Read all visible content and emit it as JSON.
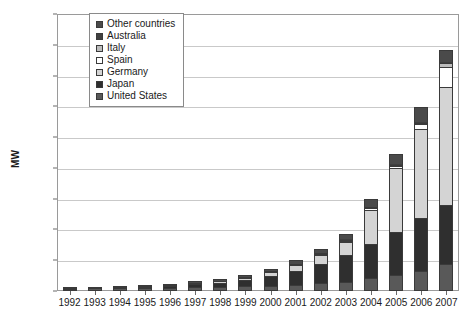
{
  "chart_data": {
    "type": "bar",
    "stacked": true,
    "title": "",
    "xlabel": "",
    "ylabel": "MW",
    "ylim": [
      0,
      9000
    ],
    "ytick_step": 1000,
    "yticks": [
      0,
      1000,
      2000,
      3000,
      4000,
      5000,
      6000,
      7000,
      8000,
      9000
    ],
    "grid": true,
    "legend_position": "top-left-inside",
    "categories": [
      "1992",
      "1993",
      "1994",
      "1995",
      "1996",
      "1997",
      "1998",
      "1999",
      "2000",
      "2001",
      "2002",
      "2003",
      "2004",
      "2005",
      "2006",
      "2007"
    ],
    "series": [
      {
        "name": "United States",
        "color": "#595959",
        "values": [
          44,
          50,
          58,
          66,
          77,
          89,
          100,
          117,
          139,
          168,
          212,
          275,
          376,
          479,
          624,
          831
        ]
      },
      {
        "name": "Japan",
        "color": "#2f2f2f",
        "values": [
          19,
          24,
          31,
          43,
          60,
          91,
          133,
          209,
          318,
          453,
          637,
          860,
          1132,
          1422,
          1708,
          1919
        ]
      },
      {
        "name": "Germany",
        "color": "#d4d4d4",
        "values": [
          6,
          9,
          12,
          18,
          28,
          42,
          54,
          70,
          114,
          195,
          296,
          435,
          1105,
          2056,
          2899,
          3846
        ]
      },
      {
        "name": "Spain",
        "color": "#ffffff",
        "values": [
          1,
          2,
          3,
          4,
          5,
          7,
          9,
          12,
          16,
          21,
          27,
          34,
          44,
          58,
          148,
          655
        ]
      },
      {
        "name": "Italy",
        "color": "#bdbdbd",
        "values": [
          5,
          7,
          9,
          11,
          13,
          16,
          18,
          19,
          20,
          22,
          24,
          26,
          31,
          38,
          51,
          120
        ]
      },
      {
        "name": "Australia",
        "color": "#404040",
        "values": [
          7,
          9,
          11,
          13,
          16,
          19,
          22,
          25,
          29,
          34,
          39,
          45,
          52,
          61,
          70,
          82
        ]
      },
      {
        "name": "Other countries",
        "color": "#4a4a4a",
        "values": [
          18,
          22,
          27,
          33,
          41,
          50,
          61,
          76,
          94,
          114,
          142,
          180,
          240,
          330,
          470,
          390
        ]
      }
    ],
    "totals": [
      100,
      123,
      151,
      188,
      240,
      314,
      397,
      528,
      730,
      1007,
      1377,
      1855,
      2980,
      4444,
      5970,
      7843
    ],
    "legend_entries": [
      "Other countries",
      "Australia",
      "Italy",
      "Spain",
      "Germany",
      "Japan",
      "United States"
    ]
  }
}
